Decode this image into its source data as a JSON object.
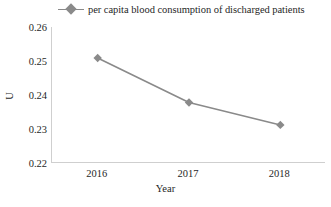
{
  "chart_data": {
    "type": "line",
    "title": "",
    "subtitle": "",
    "xlabel": "Year",
    "ylabel": "U",
    "categories": [
      "2016",
      "2017",
      "2018"
    ],
    "values": [
      0.2509,
      0.2378,
      0.2312
    ],
    "series": [
      {
        "name": "per capita blood consumption of discharged patients",
        "values": [
          0.2509,
          0.2378,
          0.2312
        ]
      }
    ],
    "ylim": [
      0.22,
      0.26
    ],
    "yticks": [
      "0.26",
      "0.25",
      "0.24",
      "0.23",
      "0.22"
    ],
    "ytick_values": [
      0.26,
      0.25,
      0.24,
      0.23,
      0.22
    ],
    "xticks": [
      "2016",
      "2017",
      "2018"
    ],
    "grid": false,
    "legend_position": "top",
    "marker": "diamond",
    "line_color": "#8a8a8a",
    "marker_color": "#8a8a8a",
    "axis_color": "#cfcfcf"
  },
  "legend": {
    "label": "per capita blood consumption of discharged patients",
    "marker_icon": "diamond-marker-icon"
  },
  "axes": {
    "y_title": "U",
    "x_title": "Year"
  }
}
